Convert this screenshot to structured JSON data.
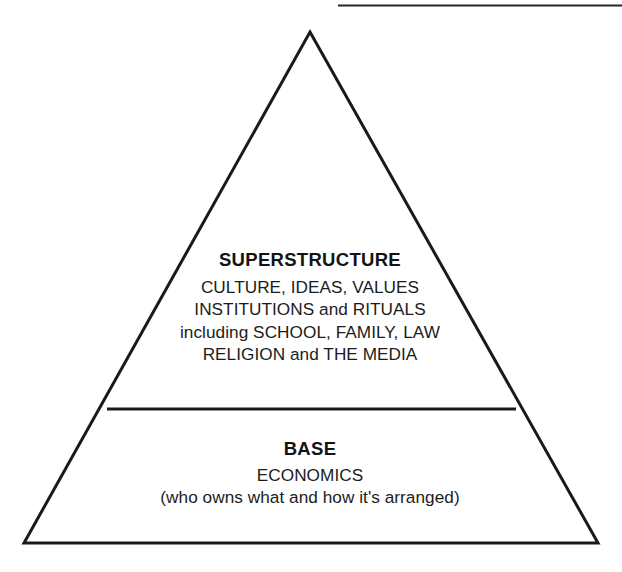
{
  "diagram": {
    "name": "base-and-superstructure-pyramid",
    "type": "pyramid",
    "background_color": "#ffffff",
    "stroke_color": "#1a1a1a",
    "text_color": "#1a1a1a",
    "top_rule": {
      "name": "top-horizontal-rule",
      "x1": 338,
      "y1": 5,
      "x2": 622,
      "y2": 5,
      "thickness": 2
    },
    "triangle": {
      "apex_x": 310,
      "apex_y": 32,
      "bottom_left_x": 24,
      "bottom_left_y": 543,
      "bottom_right_x": 598,
      "bottom_right_y": 543,
      "stroke_width": 3
    },
    "divider": {
      "name": "section-divider",
      "x1": 107,
      "y1": 409,
      "x2": 516,
      "y2": 409,
      "thickness": 3
    }
  },
  "superstructure": {
    "heading": "SUPERSTRUCTURE",
    "lines": [
      "CULTURE, IDEAS, VALUES",
      "INSTITUTIONS and RITUALS",
      "including SCHOOL, FAMILY, LAW",
      "RELIGION and THE MEDIA"
    ]
  },
  "base": {
    "heading": "BASE",
    "lines": [
      "ECONOMICS",
      "(who owns what and how it's arranged)"
    ]
  }
}
